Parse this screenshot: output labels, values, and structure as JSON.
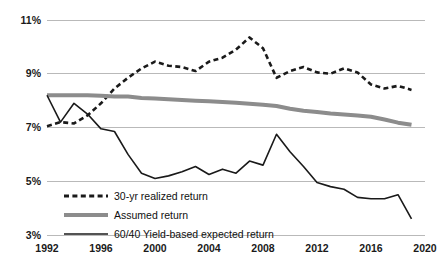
{
  "chart_data": {
    "type": "line",
    "title": "",
    "xlabel": "",
    "ylabel": "",
    "xlim": [
      1992,
      2020
    ],
    "ylim": [
      3,
      11
    ],
    "grid": true,
    "legend_position": "inside-bottom-left",
    "x_ticks": [
      "1992",
      "1996",
      "2000",
      "2004",
      "2008",
      "2012",
      "2016",
      "2020"
    ],
    "x_tick_values": [
      1992,
      1996,
      2000,
      2004,
      2008,
      2012,
      2016,
      2020
    ],
    "y_ticks": [
      "3%",
      "5%",
      "7%",
      "9%",
      "11%"
    ],
    "y_tick_values": [
      3,
      5,
      7,
      9,
      11
    ],
    "x": [
      1992,
      1993,
      1994,
      1995,
      1996,
      1997,
      1998,
      1999,
      2000,
      2001,
      2002,
      2003,
      2004,
      2005,
      2006,
      2007,
      2008,
      2009,
      2010,
      2011,
      2012,
      2013,
      2014,
      2015,
      2016,
      2017,
      2018,
      2019
    ],
    "series": [
      {
        "name": "30-yr realized return",
        "style": "dashed",
        "color": "#1a1a1a",
        "width": 2.6,
        "values": [
          7.05,
          7.2,
          7.15,
          7.45,
          7.9,
          8.45,
          8.85,
          9.2,
          9.45,
          9.3,
          9.25,
          9.1,
          9.45,
          9.6,
          9.9,
          10.35,
          9.95,
          8.85,
          9.1,
          9.25,
          9.05,
          9.0,
          9.2,
          9.05,
          8.6,
          8.45,
          8.55,
          8.4
        ]
      },
      {
        "name": "Assumed return",
        "style": "solid",
        "color": "#8c8c8c",
        "width": 4.0,
        "values": [
          8.2,
          8.2,
          8.2,
          8.2,
          8.18,
          8.15,
          8.15,
          8.1,
          8.08,
          8.05,
          8.02,
          8.0,
          7.98,
          7.95,
          7.92,
          7.88,
          7.85,
          7.8,
          7.7,
          7.62,
          7.58,
          7.52,
          7.48,
          7.45,
          7.4,
          7.3,
          7.18,
          7.1
        ]
      },
      {
        "name": "60/40 Yield-based expected return",
        "style": "solid",
        "color": "#1a1a1a",
        "width": 1.6,
        "values": [
          8.2,
          7.2,
          7.9,
          7.5,
          6.95,
          6.85,
          6.0,
          5.3,
          5.1,
          5.2,
          5.35,
          5.55,
          5.25,
          5.45,
          5.3,
          5.75,
          5.6,
          6.75,
          6.1,
          5.55,
          4.95,
          4.8,
          4.7,
          4.4,
          4.35,
          4.35,
          4.5,
          3.6
        ]
      }
    ],
    "legend": [
      {
        "label": "30-yr realized return",
        "style": "dashed",
        "color": "#1a1a1a"
      },
      {
        "label": "Assumed return",
        "style": "solid-thick",
        "color": "#8c8c8c"
      },
      {
        "label": "60/40 Yield-based expected return",
        "style": "solid-thin",
        "color": "#1a1a1a"
      }
    ]
  }
}
